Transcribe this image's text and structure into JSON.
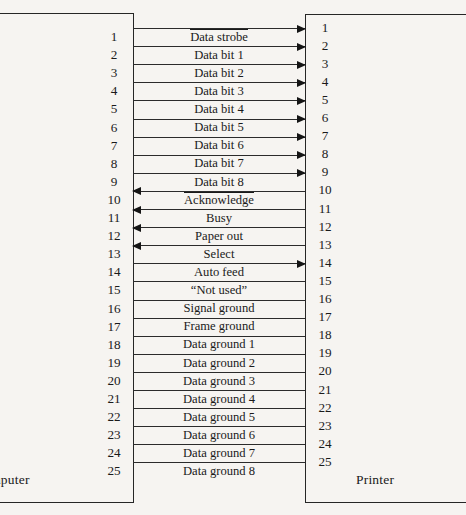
{
  "diagram": {
    "left_device": "Computer",
    "right_device": "Printer",
    "pin_count": 25,
    "line_color": "#2b2b2b",
    "background_color": "#f6f4f1"
  },
  "signals": [
    {
      "pin": 1,
      "label": "Data strobe",
      "overline": true,
      "direction": "right"
    },
    {
      "pin": 2,
      "label": "Data bit 1",
      "overline": false,
      "direction": "right"
    },
    {
      "pin": 3,
      "label": "Data bit 2",
      "overline": false,
      "direction": "right"
    },
    {
      "pin": 4,
      "label": "Data bit 3",
      "overline": false,
      "direction": "right"
    },
    {
      "pin": 5,
      "label": "Data bit 4",
      "overline": false,
      "direction": "right"
    },
    {
      "pin": 6,
      "label": "Data bit 5",
      "overline": false,
      "direction": "right"
    },
    {
      "pin": 7,
      "label": "Data bit 6",
      "overline": false,
      "direction": "right"
    },
    {
      "pin": 8,
      "label": "Data bit 7",
      "overline": false,
      "direction": "right"
    },
    {
      "pin": 9,
      "label": "Data bit 8",
      "overline": false,
      "direction": "right"
    },
    {
      "pin": 10,
      "label": "Acknowledge",
      "overline": true,
      "direction": "left"
    },
    {
      "pin": 11,
      "label": "Busy",
      "overline": false,
      "direction": "left"
    },
    {
      "pin": 12,
      "label": "Paper out",
      "overline": false,
      "direction": "left"
    },
    {
      "pin": 13,
      "label": "Select",
      "overline": false,
      "direction": "left"
    },
    {
      "pin": 14,
      "label": "Auto feed",
      "overline": false,
      "direction": "right"
    },
    {
      "pin": 15,
      "label": "“Not used”",
      "overline": false,
      "direction": "none"
    },
    {
      "pin": 16,
      "label": "Signal ground",
      "overline": false,
      "direction": "none"
    },
    {
      "pin": 17,
      "label": "Frame ground",
      "overline": false,
      "direction": "none"
    },
    {
      "pin": 18,
      "label": "Data ground 1",
      "overline": false,
      "direction": "none"
    },
    {
      "pin": 19,
      "label": "Data ground 2",
      "overline": false,
      "direction": "none"
    },
    {
      "pin": 20,
      "label": "Data ground 3",
      "overline": false,
      "direction": "none"
    },
    {
      "pin": 21,
      "label": "Data ground 4",
      "overline": false,
      "direction": "none"
    },
    {
      "pin": 22,
      "label": "Data ground 5",
      "overline": false,
      "direction": "none"
    },
    {
      "pin": 23,
      "label": "Data ground 6",
      "overline": false,
      "direction": "none"
    },
    {
      "pin": 24,
      "label": "Data ground 7",
      "overline": false,
      "direction": "none"
    },
    {
      "pin": 25,
      "label": "Data ground 8",
      "overline": false,
      "direction": "none"
    }
  ]
}
